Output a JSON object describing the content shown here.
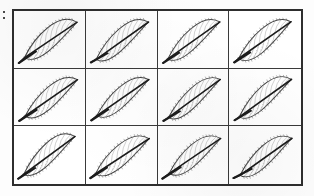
{
  "figure": {
    "kind": "botanical-specimen-plate",
    "margin_mark": ":",
    "background_color": "#fdfdfd",
    "frame_color": "#2e2e2e",
    "divider_color": "#3a3a3a",
    "ink_color": "#404040",
    "midrib_color": "#1c1c1c",
    "vein_color": "#8d8d8d",
    "grid": {
      "columns": 4,
      "rows": 3,
      "total_cells": 12
    }
  },
  "cells": [
    {
      "id": "cell-r1c1",
      "row": 1,
      "column": 1,
      "specimen": "leaf-1",
      "label": "1",
      "leaf_type": "ovate-serrate",
      "venation": "pinnate",
      "orientation": "petiole-lower-left"
    },
    {
      "id": "cell-r1c2",
      "row": 1,
      "column": 2,
      "specimen": "leaf-2",
      "label": "2",
      "leaf_type": "ovate-serrate",
      "venation": "pinnate",
      "orientation": "petiole-lower-left"
    },
    {
      "id": "cell-r1c3",
      "row": 1,
      "column": 3,
      "specimen": "leaf-3",
      "label": "3",
      "leaf_type": "ovate-serrate",
      "venation": "pinnate",
      "orientation": "petiole-lower-left"
    },
    {
      "id": "cell-r1c4",
      "row": 1,
      "column": 4,
      "specimen": "leaf-4",
      "label": "4",
      "leaf_type": "ovate-serrate",
      "venation": "pinnate",
      "orientation": "petiole-lower-left"
    },
    {
      "id": "cell-r2c1",
      "row": 2,
      "column": 1,
      "specimen": "leaf-5",
      "label": "5",
      "leaf_type": "ovate-serrate",
      "venation": "pinnate",
      "orientation": "petiole-lower-left"
    },
    {
      "id": "cell-r2c2",
      "row": 2,
      "column": 2,
      "specimen": "leaf-6",
      "label": "6",
      "leaf_type": "ovate-serrate",
      "venation": "pinnate",
      "orientation": "petiole-lower-left"
    },
    {
      "id": "cell-r2c3",
      "row": 2,
      "column": 3,
      "specimen": "leaf-7",
      "label": "7",
      "leaf_type": "ovate-serrate",
      "venation": "pinnate",
      "orientation": "petiole-lower-left"
    },
    {
      "id": "cell-r2c4",
      "row": 2,
      "column": 4,
      "specimen": "leaf-8",
      "label": "8",
      "leaf_type": "ovate-serrate",
      "venation": "pinnate",
      "orientation": "petiole-lower-left"
    },
    {
      "id": "cell-r3c1",
      "row": 3,
      "column": 1,
      "specimen": "leaf-9",
      "label": "9",
      "leaf_type": "ovate-serrate",
      "venation": "pinnate",
      "orientation": "petiole-lower-left"
    },
    {
      "id": "cell-r3c2",
      "row": 3,
      "column": 2,
      "specimen": "leaf-10",
      "label": "10",
      "leaf_type": "ovate-serrate",
      "venation": "pinnate",
      "orientation": "petiole-lower-left"
    },
    {
      "id": "cell-r3c3",
      "row": 3,
      "column": 3,
      "specimen": "leaf-11",
      "label": "11",
      "leaf_type": "ovate-serrate",
      "venation": "pinnate",
      "orientation": "petiole-lower-left"
    },
    {
      "id": "cell-r3c4",
      "row": 3,
      "column": 4,
      "specimen": "leaf-12",
      "label": "12",
      "leaf_type": "ovate-serrate",
      "venation": "pinnate",
      "orientation": "petiole-lower-left"
    }
  ]
}
